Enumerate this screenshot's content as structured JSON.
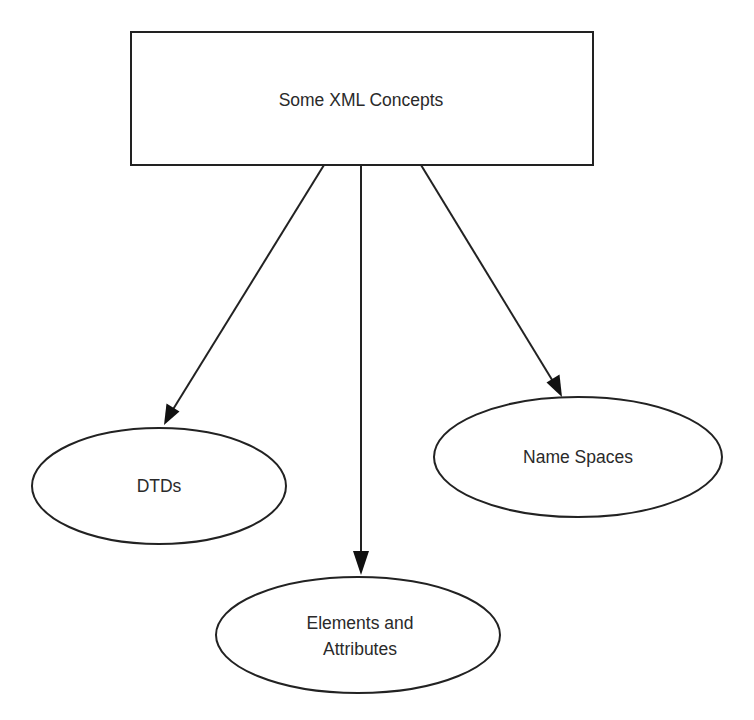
{
  "diagram": {
    "type": "hierarchy",
    "colors": {
      "stroke": "#222222",
      "text": "#2a2a2a",
      "background": "#ffffff",
      "fill": "#ffffff"
    },
    "root": {
      "id": "root",
      "label": "Some XML Concepts",
      "shape": "rectangle"
    },
    "children": [
      {
        "id": "dtds",
        "label": "DTDs",
        "shape": "ellipse"
      },
      {
        "id": "elements-attributes",
        "label_lines": [
          "Elements and",
          "Attributes"
        ],
        "shape": "ellipse"
      },
      {
        "id": "name-spaces",
        "label": "Name Spaces",
        "shape": "ellipse"
      }
    ],
    "edges": [
      {
        "from": "root",
        "to": "dtds",
        "style": "arrow"
      },
      {
        "from": "root",
        "to": "elements-attributes",
        "style": "arrow"
      },
      {
        "from": "root",
        "to": "name-spaces",
        "style": "arrow"
      }
    ]
  }
}
